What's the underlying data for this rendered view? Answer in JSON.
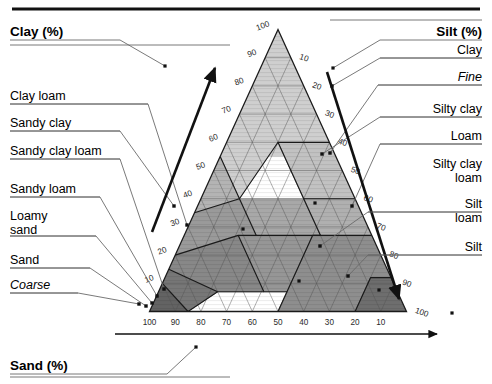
{
  "figure": {
    "kind": "soil-texture-triangle",
    "top_rule": true
  },
  "axes": {
    "clay": {
      "title": "Clay (%)",
      "ticks": [
        "100",
        "90",
        "80",
        "70",
        "60",
        "50",
        "40",
        "30",
        "20",
        "10"
      ],
      "arrow_direction": "up-right"
    },
    "silt": {
      "title": "Silt (%)",
      "ticks": [
        "10",
        "20",
        "30",
        "40",
        "50",
        "60",
        "70",
        "80",
        "90",
        "100"
      ],
      "arrow_direction": "down-right"
    },
    "sand": {
      "title": "Sand (%)",
      "ticks": [
        "100",
        "90",
        "80",
        "70",
        "60",
        "50",
        "40",
        "30",
        "20",
        "10"
      ],
      "arrow_direction": "right"
    }
  },
  "left_labels": [
    {
      "text": "Clay loam",
      "style": "normal"
    },
    {
      "text": "Sandy clay",
      "style": "normal"
    },
    {
      "text": "Sandy clay loam",
      "style": "normal"
    },
    {
      "text": "Sandy loam",
      "style": "normal"
    },
    {
      "text": "Loamy",
      "style": "normal"
    },
    {
      "text": "sand",
      "style": "normal"
    },
    {
      "text": "Sand",
      "style": "normal"
    },
    {
      "text": "Coarse",
      "style": "italic"
    }
  ],
  "right_labels": [
    {
      "text": "Clay",
      "style": "normal"
    },
    {
      "text": "Fine",
      "style": "italic"
    },
    {
      "text": "Silty clay",
      "style": "normal"
    },
    {
      "text": "Loam",
      "style": "normal"
    },
    {
      "text": "Silty clay",
      "style": "normal"
    },
    {
      "text": "loam",
      "style": "normal"
    },
    {
      "text": "Silt",
      "style": "normal"
    },
    {
      "text": "loam",
      "style": "normal"
    },
    {
      "text": "Silt",
      "style": "normal"
    }
  ],
  "chart_data": {
    "type": "other",
    "xlabel": "Sand (%)",
    "ylabel": "Clay (%)",
    "zlabel": "Silt (%)",
    "grid": true,
    "axis_range": [
      0,
      100
    ],
    "tick_step": 10,
    "classes": [
      {
        "name": "Clay",
        "fill": "#cfcfcf",
        "callout_side": "right"
      },
      {
        "name": "Silty clay",
        "fill": "#c2c2c2",
        "callout_side": "right"
      },
      {
        "name": "Sandy clay",
        "fill": "#b4b4b4",
        "callout_side": "left"
      },
      {
        "name": "Clay loam",
        "fill": "#a8a8a8",
        "callout_side": "left"
      },
      {
        "name": "Silty clay loam",
        "fill": "#b0b0b0",
        "callout_side": "right"
      },
      {
        "name": "Sandy clay loam",
        "fill": "#9a9a9a",
        "callout_side": "left"
      },
      {
        "name": "Loam",
        "fill": "#969696",
        "callout_side": "right"
      },
      {
        "name": "Silt loam",
        "fill": "#8e8e8e",
        "callout_side": "right"
      },
      {
        "name": "Silt",
        "fill": "#6e6e6e",
        "callout_side": "right"
      },
      {
        "name": "Sandy loam",
        "fill": "#888888",
        "callout_side": "left"
      },
      {
        "name": "Loamy sand",
        "fill": "#777777",
        "callout_side": "left"
      },
      {
        "name": "Sand",
        "fill": "#636363",
        "callout_side": "left"
      }
    ],
    "grouping": {
      "coarse": "Coarse",
      "fine": "Fine"
    }
  }
}
